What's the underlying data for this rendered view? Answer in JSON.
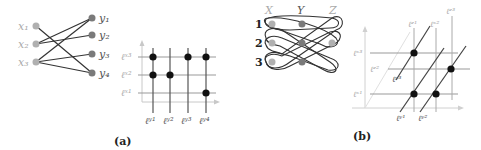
{
  "panel_a": {
    "caption": "(a)",
    "bipartite": {
      "left_nodes": [
        "x1",
        "x2",
        "x3"
      ],
      "right_nodes": [
        "y1",
        "y2",
        "y3",
        "y4"
      ],
      "left_labels": [
        "x₁",
        "x₂",
        "x₃"
      ],
      "right_labels": [
        "y₁",
        "y₂",
        "y₃",
        "y₄"
      ],
      "edges": [
        [
          "x1",
          "y4"
        ],
        [
          "x2",
          "y1"
        ],
        [
          "x2",
          "y2"
        ],
        [
          "x3",
          "y1"
        ],
        [
          "x3",
          "y3"
        ],
        [
          "x3",
          "y4"
        ]
      ]
    },
    "grid": {
      "row_labels": [
        "ℓˣ³",
        "ℓˣ²",
        "ℓˣ¹"
      ],
      "col_labels": [
        "ℓʸ¹",
        "ℓʸ²",
        "ℓʸ³",
        "ℓʸ⁴"
      ],
      "points": [
        [
          "x3",
          "y1"
        ],
        [
          "x3",
          "y3"
        ],
        [
          "x3",
          "y4"
        ],
        [
          "x2",
          "y1"
        ],
        [
          "x2",
          "y2"
        ],
        [
          "x1",
          "y4"
        ]
      ]
    }
  },
  "panel_b": {
    "caption": "(b)",
    "hypergraph": {
      "column_labels": [
        "X",
        "Y",
        "Z"
      ],
      "row_labels": [
        "1",
        "2",
        "3"
      ]
    },
    "grid3d": {
      "horizontal_labels": [
        "ℓˣ³",
        "ℓᶻ²",
        "ℓˣ¹"
      ],
      "vertical_labels": [
        "ℓᶻ¹",
        "ℓˣ²",
        "ℓᶻ³"
      ],
      "diagonal_labels": [
        "ℓʸ³",
        "ℓʸ¹",
        "ℓʸ²"
      ]
    }
  },
  "colors": {
    "node_light": "#b0b0b0",
    "node_dark": "#7a7a7a",
    "point": "#111111",
    "line": "#333333",
    "grid_line": "#999999",
    "axis": "#c8c8c8"
  }
}
